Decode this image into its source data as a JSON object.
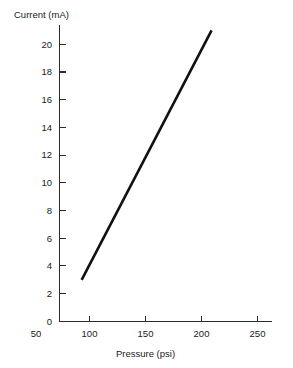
{
  "chart_data": {
    "type": "line",
    "title": "",
    "xlabel": "Pressure (psi)",
    "ylabel": "Current (mA)",
    "xlim": [
      50,
      275
    ],
    "ylim": [
      0,
      21.5
    ],
    "grid": false,
    "legend": false,
    "x_ticks": [
      50,
      100,
      150,
      200,
      250
    ],
    "x_tick_labels": [
      "50",
      "100",
      "150",
      "200",
      "250"
    ],
    "y_ticks": [
      0,
      2,
      4,
      6,
      8,
      10,
      12,
      14,
      16,
      18,
      20
    ],
    "y_tick_labels": [
      "0",
      "2",
      "4",
      "6",
      "8",
      "10",
      "12",
      "14",
      "16",
      "18",
      "20"
    ],
    "series": [
      {
        "name": "Current vs Pressure",
        "x": [
          93,
          209
        ],
        "values": [
          3,
          21
        ],
        "color": "#111111"
      }
    ],
    "annotations": []
  },
  "axes": {
    "y_title": "Current (mA)",
    "x_title": "Pressure (psi)",
    "axis_color": "#2b2b2b",
    "line_color": "#111111"
  },
  "y_tick_labels": [
    "20",
    "18",
    "16",
    "14",
    "12",
    "10",
    "8",
    "6",
    "4",
    "2",
    "0"
  ],
  "x_tick_labels": [
    "50",
    "100",
    "150",
    "200",
    "250"
  ]
}
